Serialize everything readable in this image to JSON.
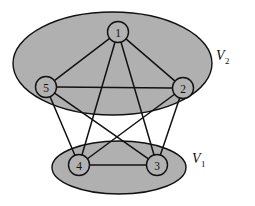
{
  "figure": {
    "kind": "graph-partition-diagram",
    "width": 255,
    "height": 206,
    "background_color": "#ffffff",
    "ellipse_fill": "#b0b0b0",
    "node_fill": "#b2b2b2",
    "stroke_color": "#111111"
  },
  "sets": [
    {
      "id": "V2",
      "label_main": "V",
      "label_sub": "2",
      "label_x": 216,
      "label_y": 60,
      "cx": 112.5,
      "cy": 63.5,
      "rx": 99.5,
      "ry": 51.5,
      "members": [
        "1",
        "2",
        "5"
      ]
    },
    {
      "id": "V1",
      "label_main": "V",
      "label_sub": "1",
      "label_x": 192,
      "label_y": 163,
      "cx": 119,
      "cy": 167.5,
      "rx": 67,
      "ry": 26.5,
      "members": [
        "3",
        "4"
      ]
    }
  ],
  "nodes": [
    {
      "id": "1",
      "label": "1",
      "x": 118,
      "y": 32,
      "r": 10.5,
      "set": "V2"
    },
    {
      "id": "2",
      "label": "2",
      "x": 183,
      "y": 88,
      "r": 10.5,
      "set": "V2"
    },
    {
      "id": "3",
      "label": "3",
      "x": 157,
      "y": 165,
      "r": 10.5,
      "set": "V1"
    },
    {
      "id": "4",
      "label": "4",
      "x": 79,
      "y": 165,
      "r": 10.5,
      "set": "V1"
    },
    {
      "id": "5",
      "label": "5",
      "x": 46,
      "y": 87,
      "r": 10.5,
      "set": "V2"
    }
  ],
  "edges": [
    {
      "from": "1",
      "to": "2"
    },
    {
      "from": "1",
      "to": "3"
    },
    {
      "from": "1",
      "to": "4"
    },
    {
      "from": "1",
      "to": "5"
    },
    {
      "from": "2",
      "to": "3"
    },
    {
      "from": "2",
      "to": "4"
    },
    {
      "from": "2",
      "to": "5"
    },
    {
      "from": "3",
      "to": "4"
    },
    {
      "from": "3",
      "to": "5"
    },
    {
      "from": "4",
      "to": "5"
    }
  ]
}
